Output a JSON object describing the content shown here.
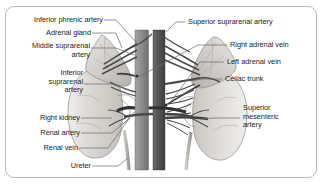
{
  "figure": {
    "border_color": "#b9b9b9",
    "background_color": "#ffffff",
    "leader_line_color": "#5a5a5a",
    "text_color": "#1d1d1d"
  },
  "structures": {
    "aorta": {
      "name": "Abdominal aorta",
      "color": "#595959"
    },
    "inferior_vena_cava": {
      "name": "Inferior vena cava",
      "color": "#8a8a8a"
    },
    "kidney_left_of_view": {
      "name": "Right kidney",
      "color": "#d8d6d2"
    },
    "kidney_right_of_view": {
      "name": "Left kidney",
      "color": "#dcdad6"
    },
    "adrenal_left_of_view": {
      "name": "Right adrenal gland",
      "color": "#c9c6c1"
    },
    "adrenal_right_of_view": {
      "name": "Left adrenal gland",
      "color": "#c9c6c1"
    }
  },
  "labels_left": [
    {
      "id": "inferior-phrenic-artery",
      "text": "Inferior phrenic artery"
    },
    {
      "id": "adrenal-gland",
      "text": "Adrenal gland"
    },
    {
      "id": "middle-suprarenal-artery",
      "line1": "Middle suprarenal",
      "line2": "artery"
    },
    {
      "id": "inferior-suprarenal-artery",
      "line1": "Inferior",
      "line2": "suprarenal",
      "line3": "artery"
    },
    {
      "id": "right-kidney",
      "text": "Right kidney"
    },
    {
      "id": "renal-artery",
      "text": "Renal artery"
    },
    {
      "id": "renal-vein",
      "text": "Renal vein"
    },
    {
      "id": "ureter",
      "text": "Ureter"
    }
  ],
  "labels_right": [
    {
      "id": "superior-suprarenal-artery",
      "text": "Superior suprarenal artery"
    },
    {
      "id": "right-adrenal-vein",
      "text": "Right adrenal vein"
    },
    {
      "id": "left-adrenal-vein",
      "text": "Left adrenal vein"
    },
    {
      "id": "celiac-trunk",
      "text": "Celiac trunk"
    },
    {
      "id": "superior-mesenteric-artery",
      "line1": "Superior",
      "line2": "mesenteric",
      "line3": "artery"
    }
  ]
}
